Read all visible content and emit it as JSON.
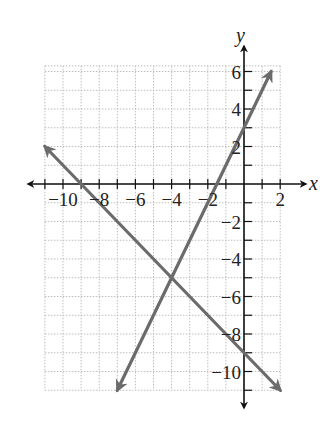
{
  "chart_data": {
    "type": "line",
    "title": "",
    "xlabel": "x",
    "ylabel": "y",
    "xlim": [
      -11,
      2
    ],
    "ylim": [
      -11,
      6
    ],
    "grid": true,
    "x_ticks": [
      -10,
      -8,
      -6,
      -4,
      -2,
      2
    ],
    "y_ticks": [
      6,
      4,
      2,
      -2,
      -4,
      -6,
      -8,
      -10
    ],
    "series": [
      {
        "name": "line-1",
        "equation": "y = 2x + 3",
        "slope": 2,
        "intercept": 3,
        "x": [
          -7,
          1.5
        ],
        "y": [
          -11,
          6
        ],
        "color": "#6b6b6b",
        "arrows": "both"
      },
      {
        "name": "line-2",
        "equation": "y = -x - 9",
        "slope": -1,
        "intercept": -9,
        "x": [
          -11,
          2
        ],
        "y": [
          2,
          -11
        ],
        "color": "#6b6b6b",
        "arrows": "both"
      }
    ],
    "intersection": {
      "x": -4,
      "y": -5
    }
  },
  "labels": {
    "x_axis": "x",
    "y_axis": "y",
    "x_tick_labels": [
      "−10",
      "−8",
      "−6",
      "−4",
      "−2",
      "2"
    ],
    "y_tick_labels": [
      "6",
      "4",
      "2",
      "−2",
      "−4",
      "−6",
      "−8",
      "−10"
    ]
  },
  "colors": {
    "axis": "#111111",
    "grid": "#bdbdbd",
    "line": "#6b6b6b"
  }
}
